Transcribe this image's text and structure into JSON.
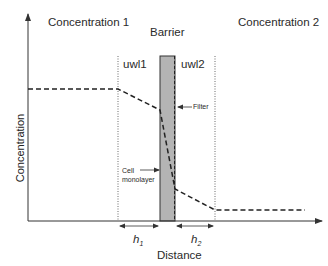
{
  "diagram": {
    "regions": {
      "left": "Concentration 1",
      "barrier": "Barrier",
      "right": "Concentration 2"
    },
    "layers": {
      "uwl1": "uwl1",
      "uwl2": "uwl2"
    },
    "annotations": {
      "filter": "Filter",
      "cell_line1": "Cell",
      "cell_line2": "monolayer"
    },
    "axes": {
      "xlabel": "Distance",
      "ylabel": "Concentration"
    },
    "widths": {
      "h1_base": "h",
      "h1_sub": "1",
      "h2_base": "h",
      "h2_sub": "2"
    },
    "colors": {
      "barrier_fill": "#b4b4b4",
      "line": "#222222"
    }
  }
}
